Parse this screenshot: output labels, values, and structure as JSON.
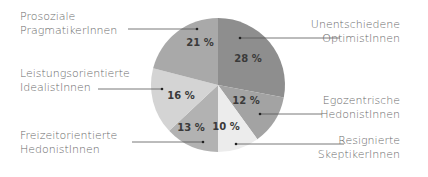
{
  "chart_data": {
    "type": "pie",
    "title": "",
    "start_angle_deg": 0,
    "direction": "clockwise",
    "slices": [
      {
        "label_lines": [
          "Unentschiedene",
          "OptimistInnen"
        ],
        "value": 28,
        "value_label": "28 %",
        "color": "#8e8e8e",
        "side": "right"
      },
      {
        "label_lines": [
          "Egozentrische",
          "HedonistInnen"
        ],
        "value": 12,
        "value_label": "12 %",
        "color": "#a3a3a3",
        "side": "right"
      },
      {
        "label_lines": [
          "Resignierte",
          "SkeptikerInnen"
        ],
        "value": 10,
        "value_label": "10 %",
        "color": "#ececec",
        "side": "right"
      },
      {
        "label_lines": [
          "Freizeitorientierte",
          "HedonistInnen"
        ],
        "value": 13,
        "value_label": "13 %",
        "color": "#b2b2b2",
        "side": "left"
      },
      {
        "label_lines": [
          "Leistungsorientierte",
          "IdealistInnen"
        ],
        "value": 16,
        "value_label": "16 %",
        "color": "#d4d4d4",
        "side": "left"
      },
      {
        "label_lines": [
          "Prosoziale",
          "PragmatikerInnen"
        ],
        "value": 21,
        "value_label": "21 %",
        "color": "#a9a9a9",
        "side": "left"
      }
    ],
    "unit": "%"
  }
}
